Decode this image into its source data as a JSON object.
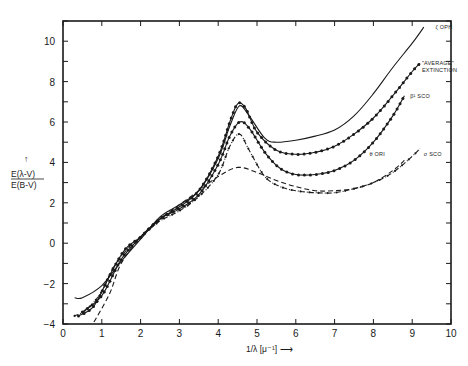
{
  "chart_data": {
    "type": "line",
    "title": "",
    "xlabel": "1/λ [μ⁻¹]",
    "ylabel_numerator": "E(λ-V)",
    "ylabel_denominator": "E(B-V)",
    "xlim": [
      0,
      10
    ],
    "ylim": [
      -4,
      11
    ],
    "x_ticks": [
      0,
      1,
      2,
      3,
      4,
      5,
      6,
      7,
      8,
      9,
      10
    ],
    "y_ticks": [
      -4,
      -2,
      0,
      2,
      4,
      6,
      8,
      10
    ],
    "grid": false,
    "legend_position": "inline labels at right end of curves",
    "series": [
      {
        "name": "ζ OPH",
        "style": "solid",
        "label_pos": [
          9.6,
          10.6
        ],
        "points": [
          [
            0.3,
            -2.7
          ],
          [
            0.5,
            -2.7
          ],
          [
            1.0,
            -2.1
          ],
          [
            1.5,
            -0.9
          ],
          [
            2.0,
            0.2
          ],
          [
            2.5,
            1.3
          ],
          [
            3.0,
            1.9
          ],
          [
            3.5,
            2.6
          ],
          [
            4.0,
            4.2
          ],
          [
            4.3,
            5.8
          ],
          [
            4.55,
            6.8
          ],
          [
            4.8,
            6.3
          ],
          [
            5.2,
            5.2
          ],
          [
            5.5,
            5.0
          ],
          [
            6.0,
            5.1
          ],
          [
            6.5,
            5.3
          ],
          [
            7.0,
            5.6
          ],
          [
            7.5,
            6.3
          ],
          [
            8.0,
            7.4
          ],
          [
            8.5,
            8.7
          ],
          [
            9.0,
            9.9
          ],
          [
            9.3,
            10.7
          ]
        ]
      },
      {
        "name": "\"AVERAGE\" EXTINCTION",
        "style": "solid-dotted",
        "label_pos": [
          9.25,
          8.8
        ],
        "points": [
          [
            0.4,
            -3.6
          ],
          [
            0.8,
            -3.1
          ],
          [
            1.2,
            -1.6
          ],
          [
            1.6,
            -0.3
          ],
          [
            2.0,
            0.3
          ],
          [
            2.5,
            1.2
          ],
          [
            3.0,
            1.8
          ],
          [
            3.5,
            2.6
          ],
          [
            4.0,
            4.3
          ],
          [
            4.3,
            6.0
          ],
          [
            4.5,
            6.9
          ],
          [
            4.7,
            6.7
          ],
          [
            5.0,
            5.5
          ],
          [
            5.5,
            4.6
          ],
          [
            6.0,
            4.4
          ],
          [
            6.5,
            4.5
          ],
          [
            7.0,
            4.8
          ],
          [
            7.5,
            5.4
          ],
          [
            8.0,
            6.2
          ],
          [
            8.5,
            7.3
          ],
          [
            9.0,
            8.5
          ],
          [
            9.2,
            8.9
          ]
        ]
      },
      {
        "name": "β¹ SCO",
        "style": "solid-dotted",
        "label_pos": [
          8.95,
          7.2
        ],
        "points": [
          [
            0.5,
            -3.4
          ],
          [
            1.0,
            -2.6
          ],
          [
            1.5,
            -0.8
          ],
          [
            2.0,
            0.3
          ],
          [
            2.5,
            1.2
          ],
          [
            3.0,
            1.7
          ],
          [
            3.5,
            2.4
          ],
          [
            4.0,
            3.9
          ],
          [
            4.3,
            5.3
          ],
          [
            4.55,
            6.0
          ],
          [
            4.8,
            5.7
          ],
          [
            5.2,
            4.5
          ],
          [
            5.6,
            3.7
          ],
          [
            6.0,
            3.4
          ],
          [
            6.5,
            3.4
          ],
          [
            7.0,
            3.6
          ],
          [
            7.5,
            4.1
          ],
          [
            8.0,
            5.0
          ],
          [
            8.5,
            6.3
          ],
          [
            8.8,
            7.3
          ]
        ]
      },
      {
        "name": "θ ORI",
        "style": "dashed",
        "label_pos": [
          7.9,
          4.3
        ],
        "points": [
          [
            0.8,
            -3.9
          ],
          [
            1.2,
            -2.5
          ],
          [
            1.5,
            -1.0
          ],
          [
            2.0,
            0.3
          ],
          [
            2.5,
            1.2
          ],
          [
            3.0,
            1.9
          ],
          [
            3.5,
            2.6
          ],
          [
            4.0,
            3.3
          ],
          [
            4.5,
            3.75
          ],
          [
            5.0,
            3.5
          ],
          [
            5.5,
            3.1
          ],
          [
            6.0,
            2.8
          ],
          [
            6.5,
            2.6
          ],
          [
            7.0,
            2.6
          ],
          [
            7.5,
            2.7
          ],
          [
            8.0,
            3.0
          ],
          [
            8.5,
            3.6
          ],
          [
            8.8,
            4.1
          ]
        ]
      },
      {
        "name": "σ SCO",
        "style": "dash-dot-points",
        "label_pos": [
          9.3,
          4.3
        ],
        "points": [
          [
            0.3,
            -3.6
          ],
          [
            0.6,
            -3.3
          ],
          [
            1.0,
            -2.4
          ],
          [
            1.3,
            -1.2
          ],
          [
            1.7,
            -0.2
          ],
          [
            2.0,
            0.3
          ],
          [
            2.5,
            1.1
          ],
          [
            3.0,
            1.6
          ],
          [
            3.5,
            2.3
          ],
          [
            4.0,
            3.4
          ],
          [
            4.3,
            4.8
          ],
          [
            4.55,
            5.4
          ],
          [
            4.8,
            4.6
          ],
          [
            5.2,
            3.3
          ],
          [
            5.6,
            2.8
          ],
          [
            6.0,
            2.6
          ],
          [
            6.5,
            2.5
          ],
          [
            7.0,
            2.5
          ],
          [
            7.5,
            2.7
          ],
          [
            8.0,
            3.0
          ],
          [
            8.5,
            3.5
          ],
          [
            9.0,
            4.3
          ],
          [
            9.2,
            4.7
          ]
        ]
      }
    ]
  },
  "axes": {
    "x_title": "1/λ [μ⁻¹] ⟶",
    "y_title_num": "E(λ-V)",
    "y_title_den": "E(B-V)",
    "y_arrow": "↑"
  }
}
